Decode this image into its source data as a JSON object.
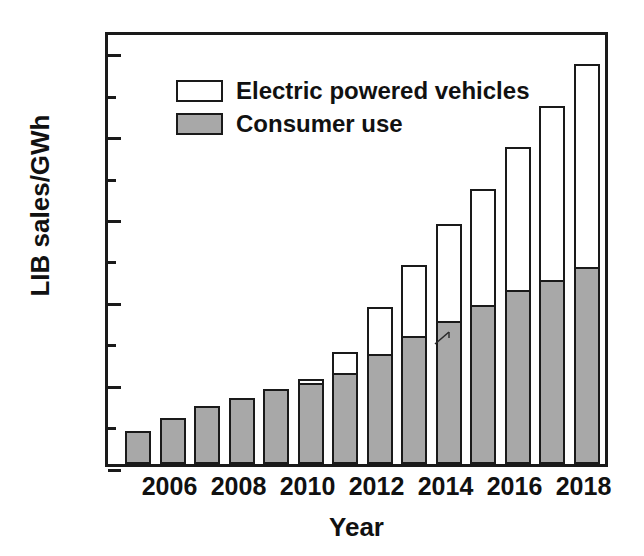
{
  "chart_data": {
    "type": "bar",
    "subtype": "stacked-bar",
    "title": "",
    "xlabel": "Year",
    "ylabel": "LIB sales/GWh",
    "ylim": [
      0,
      105
    ],
    "ytick_values": [
      0,
      20,
      40,
      60,
      80,
      100
    ],
    "ytick_labels": [
      "0",
      "20",
      "40",
      "60",
      "80",
      "100"
    ],
    "yminor_values": [
      10,
      30,
      50,
      70,
      90
    ],
    "grid": false,
    "legend_position": "upper-left-inside",
    "categories": [
      2005,
      2006,
      2007,
      2008,
      2009,
      2010,
      2011,
      2012,
      2013,
      2014,
      2015,
      2016,
      2017,
      2018
    ],
    "xtick_labels_shown": [
      "2006",
      "2008",
      "2010",
      "2012",
      "2014",
      "2016",
      "2018"
    ],
    "series": [
      {
        "name": "Consumer use",
        "color": "#a8a8a8",
        "values": [
          8,
          11,
          14,
          16,
          18,
          19.5,
          22,
          26.5,
          31,
          34.5,
          38.5,
          42,
          44.5,
          47.5
        ]
      },
      {
        "name": "Electric powered vehicles",
        "color": "#ffffff",
        "values": [
          0,
          0,
          0,
          0,
          0,
          1,
          5,
          11.5,
          17,
          23.5,
          28,
          34.5,
          42,
          49
        ]
      }
    ],
    "totals": [
      8,
      11,
      14,
      16,
      18,
      20.5,
      27,
      38,
      48,
      58,
      66.5,
      76.5,
      86.5,
      96.5
    ]
  },
  "legend": {
    "entries": [
      {
        "label": "Electric powered vehicles",
        "swatch": "white"
      },
      {
        "label": "Consumer use",
        "swatch": "gray"
      }
    ]
  },
  "axes": {
    "y_title": "LIB sales/GWh",
    "x_title": "Year",
    "y_labels": [
      "0",
      "20",
      "40",
      "60",
      "80",
      "100"
    ],
    "x_labels": [
      "2006",
      "2008",
      "2010",
      "2012",
      "2014",
      "2016",
      "2018"
    ]
  },
  "colors": {
    "axis": "#1a1a1a",
    "consumer_fill": "#a8a8a8",
    "ev_fill": "#ffffff",
    "text": "#111111",
    "background": "#ffffff"
  }
}
